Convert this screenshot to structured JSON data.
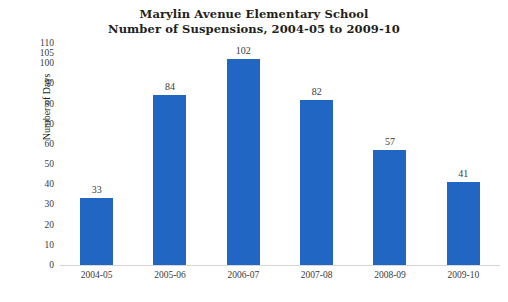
{
  "chart_data": {
    "type": "bar",
    "title": "Marylin Avenue Elementary School\nNumber of Suspensions, 2004-05 to 2009-10",
    "title_line1": "Marylin Avenue Elementary School",
    "title_line2": "Number of Suspensions, 2004-05 to 2009-10",
    "xlabel": "",
    "ylabel": "Number of Days",
    "categories": [
      "2004-05",
      "2005-06",
      "2006-07",
      "2007-08",
      "2008-09",
      "2009-10"
    ],
    "values": [
      33,
      84,
      102,
      82,
      57,
      41
    ],
    "value_labels": [
      "33",
      "84",
      "102",
      "82",
      "57",
      "41"
    ],
    "ylim": [
      0,
      110
    ],
    "ytick_values": [
      110,
      105,
      100,
      90,
      80,
      70,
      60,
      50,
      40,
      30,
      20,
      10,
      0
    ],
    "ytick_labels": [
      "110",
      "105",
      "100",
      "90",
      "80",
      "70",
      "60",
      "50",
      "40",
      "30",
      "20",
      "10",
      "0"
    ],
    "grid": false,
    "legend": null,
    "bar_color": "#2266c4",
    "background_color": "#ffffff",
    "axis_color": "#d7d7d7"
  }
}
